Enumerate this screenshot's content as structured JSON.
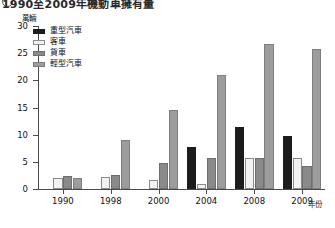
{
  "title": {
    "marker": "1",
    "text": "1990至2009年機動車擁有量"
  },
  "axes": {
    "y_unit_label": "萬輛",
    "x_axis_title": "年份",
    "y_ticks": [
      "0",
      "5",
      "10",
      "15",
      "20",
      "25",
      "30"
    ],
    "x_ticks": [
      "1990",
      "1998",
      "2000",
      "2004",
      "2008",
      "2009"
    ]
  },
  "legend": {
    "items": [
      {
        "label": "重型汽車",
        "color": "#1c1c1c",
        "border": "#1c1c1c"
      },
      {
        "label": "客車",
        "color": "#f2f2f2",
        "border": "#8c8c8c"
      },
      {
        "label": "貨車",
        "color": "#8a8a8a",
        "border": "#6e6e6e"
      },
      {
        "label": "輕型汽車",
        "color": "#9d9d9d",
        "border": "#7e7e7e"
      }
    ]
  },
  "chart_data": {
    "type": "bar",
    "title": "1990至2009年機動車擁有量",
    "xlabel": "年份",
    "ylabel": "萬輛",
    "ylim": [
      0,
      30
    ],
    "grid": false,
    "legend_position": "top-left",
    "categories": [
      "1990",
      "1998",
      "2000",
      "2004",
      "2008",
      "2009"
    ],
    "series": [
      {
        "name": "重型汽車",
        "color": "#1c1c1c",
        "values": [
          0,
          0,
          0,
          7.8,
          11.5,
          9.8
        ]
      },
      {
        "name": "客車",
        "color": "#f2f2f2",
        "values": [
          2.0,
          2.3,
          1.7,
          1.0,
          5.7,
          5.7
        ]
      },
      {
        "name": "貨車",
        "color": "#8a8a8a",
        "values": [
          2.4,
          2.5,
          4.7,
          5.8,
          5.7,
          4.2
        ]
      },
      {
        "name": "輕型汽車",
        "color": "#9d9d9d",
        "values": [
          2.1,
          9.1,
          14.5,
          21.0,
          26.6,
          25.7
        ]
      }
    ]
  }
}
